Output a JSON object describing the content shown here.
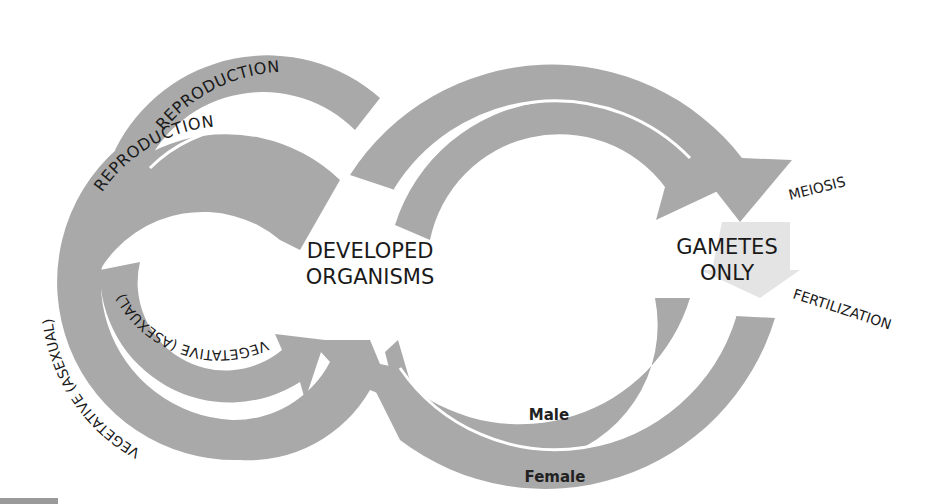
{
  "diagram": {
    "center_left": {
      "line1": "DEVELOPED",
      "line2": "ORGANISMS"
    },
    "center_right": {
      "line1": "GAMETES",
      "line2": "ONLY"
    },
    "process_labels": {
      "meiosis": "MEIOSIS",
      "fertilization": "FERTILIZATION"
    },
    "outer_left_loop": {
      "top_arc": "REPRODUCTION",
      "side_arc": "VEGETATIVE  (ASEXUAL)"
    },
    "inner_left_loop": {
      "top_arc": "REPRODUCTION",
      "side_arc": "VEGETATIVE  (ASEXUAL)"
    },
    "gamete_paths": {
      "inner": "Male",
      "outer": "Female"
    },
    "colors": {
      "arrow_fill": "#a9a9a9",
      "gamete_highlight": "#e4e4e4",
      "text": "#1a1a1a",
      "background": "#ffffff"
    }
  }
}
